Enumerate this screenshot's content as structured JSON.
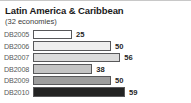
{
  "chart_data": {
    "type": "bar",
    "orientation": "horizontal",
    "title": "Latin America & Caribbean",
    "subtitle": "(32 economies)",
    "xlabel": "",
    "ylabel": "",
    "grid": false,
    "legend": "none",
    "xlim": [
      0,
      59
    ],
    "categories": [
      "DB2005",
      "DB2006",
      "DB2007",
      "DB2008",
      "DB2009",
      "DB2010"
    ],
    "values": [
      25,
      50,
      56,
      38,
      50,
      59
    ],
    "bar_colors": [
      "#ffffff",
      "#eeeeee",
      "#dcdcdc",
      "#c4c4c4",
      "#9d9d9d",
      "#232323"
    ],
    "bar_border_color": "#58585a",
    "label_color": "#58585a",
    "value_color": "#1f1f1f",
    "bars": [
      {
        "category": "DB2005",
        "value": 25,
        "value_label": "25",
        "fill": "#ffffff"
      },
      {
        "category": "DB2006",
        "value": 50,
        "value_label": "50",
        "fill": "#eeeeee"
      },
      {
        "category": "DB2007",
        "value": 56,
        "value_label": "56",
        "fill": "#dcdcdc"
      },
      {
        "category": "DB2008",
        "value": 38,
        "value_label": "38",
        "fill": "#c4c4c4"
      },
      {
        "category": "DB2009",
        "value": 50,
        "value_label": "50",
        "fill": "#9d9d9d"
      },
      {
        "category": "DB2010",
        "value": 59,
        "value_label": "59",
        "fill": "#232323"
      }
    ]
  }
}
